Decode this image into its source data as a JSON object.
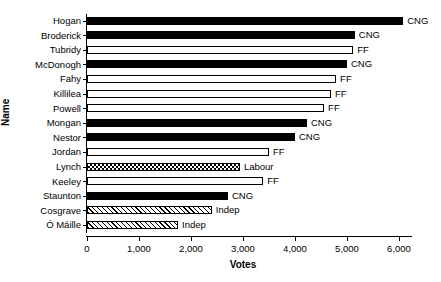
{
  "chart_data": {
    "type": "bar",
    "orientation": "horizontal",
    "title": "",
    "xlabel": "Votes",
    "ylabel": "Name",
    "xlim": [
      0,
      6500
    ],
    "grid": false,
    "legend": "none",
    "xticks": [
      0,
      1000,
      2000,
      3000,
      4000,
      5000,
      6000
    ],
    "xtick_labels": [
      "0",
      "1,000",
      "2,000",
      "3,000",
      "4,000",
      "5,000",
      "6,000"
    ],
    "categories": [
      "Hogan",
      "Broderick",
      "Tubridy",
      "McDonogh",
      "Fahy",
      "Killilea",
      "Powell",
      "Mongan",
      "Nestor",
      "Jordan",
      "Lynch",
      "Keeley",
      "Staunton",
      "Cosgrave",
      "Ó Máille"
    ],
    "values": [
      6080,
      5150,
      5120,
      5000,
      4790,
      4690,
      4560,
      4230,
      4000,
      3500,
      2940,
      3390,
      2710,
      2400,
      1750
    ],
    "annotations": [
      "CNG",
      "CNG",
      "FF",
      "CNG",
      "FF",
      "FF",
      "FF",
      "CNG",
      "CNG",
      "FF",
      "Labour",
      "FF",
      "CNG",
      "Indep",
      "Indep"
    ],
    "fills": [
      "solid",
      "solid",
      "hollow",
      "solid",
      "hollow",
      "hollow",
      "hollow",
      "solid",
      "solid",
      "hollow",
      "check",
      "hollow",
      "solid",
      "hatch",
      "hatch"
    ],
    "bars": [
      {
        "name": "Hogan",
        "value": 6080,
        "party": "CNG",
        "fill": "solid"
      },
      {
        "name": "Broderick",
        "value": 5150,
        "party": "CNG",
        "fill": "solid"
      },
      {
        "name": "Tubridy",
        "value": 5120,
        "party": "FF",
        "fill": "hollow"
      },
      {
        "name": "McDonogh",
        "value": 5000,
        "party": "CNG",
        "fill": "solid"
      },
      {
        "name": "Fahy",
        "value": 4790,
        "party": "FF",
        "fill": "hollow"
      },
      {
        "name": "Killilea",
        "value": 4690,
        "party": "FF",
        "fill": "hollow"
      },
      {
        "name": "Powell",
        "value": 4560,
        "party": "FF",
        "fill": "hollow"
      },
      {
        "name": "Mongan",
        "value": 4230,
        "party": "CNG",
        "fill": "solid"
      },
      {
        "name": "Nestor",
        "value": 4000,
        "party": "CNG",
        "fill": "solid"
      },
      {
        "name": "Jordan",
        "value": 3500,
        "party": "FF",
        "fill": "hollow"
      },
      {
        "name": "Lynch",
        "value": 2940,
        "party": "Labour",
        "fill": "check"
      },
      {
        "name": "Keeley",
        "value": 3390,
        "party": "FF",
        "fill": "hollow"
      },
      {
        "name": "Staunton",
        "value": 2710,
        "party": "CNG",
        "fill": "solid"
      },
      {
        "name": "Cosgrave",
        "value": 2400,
        "party": "Indep",
        "fill": "hatch"
      },
      {
        "name": "Ó Máille",
        "value": 1750,
        "party": "Indep",
        "fill": "hatch"
      }
    ]
  },
  "colors": {
    "axis": "#000000",
    "bar_fill_solid": "#000000",
    "bar_fill_hollow": "#ffffff",
    "background": "#ffffff"
  }
}
